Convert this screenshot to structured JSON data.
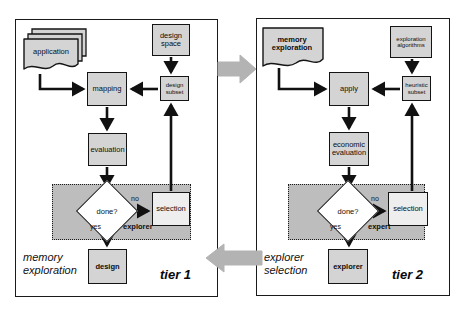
{
  "figure": {
    "type": "flow-diagram",
    "colors": {
      "node_fill": "#d4d4d4",
      "node_fill_light": "#eeeeee",
      "region_fill": "#bdbdbd",
      "stroke": "#141414",
      "big_arrow": "#b3b3b3",
      "background": "#ffffff"
    }
  },
  "tier1": {
    "tier_label": "tier 1",
    "caption_line1": "memory",
    "caption_line2": "exploration",
    "nodes": {
      "application": "application",
      "design_space_line1": "design",
      "design_space_line2": "space",
      "mapping": "mapping",
      "design_subset_line1": "design",
      "design_subset_line2": "subset",
      "evaluation": "evaluation",
      "decision": "done?",
      "selection": "selection",
      "design": "design"
    },
    "region_label": "explorer",
    "edge_labels": {
      "no": "no",
      "yes": "yes"
    }
  },
  "tier2": {
    "tier_label": "tier 2",
    "caption_line1": "explorer",
    "caption_line2": "selection",
    "nodes": {
      "memory_exploration_line1": "memory",
      "memory_exploration_line2": "exploration",
      "exploration_algorithms_line1": "exploration",
      "exploration_algorithms_line2": "algorithms",
      "apply": "apply",
      "heuristic_subset_line1": "heuristic",
      "heuristic_subset_line2": "subset",
      "economic_evaluation_line1": "economic",
      "economic_evaluation_line2": "evaluation",
      "decision": "done?",
      "selection": "selection",
      "explorer": "explorer"
    },
    "region_label": "expert",
    "edge_labels": {
      "no": "no",
      "yes": "yes"
    }
  },
  "connectors": {
    "tier1_to_tier2": "right-arrow",
    "tier2_to_tier1": "left-arrow"
  }
}
